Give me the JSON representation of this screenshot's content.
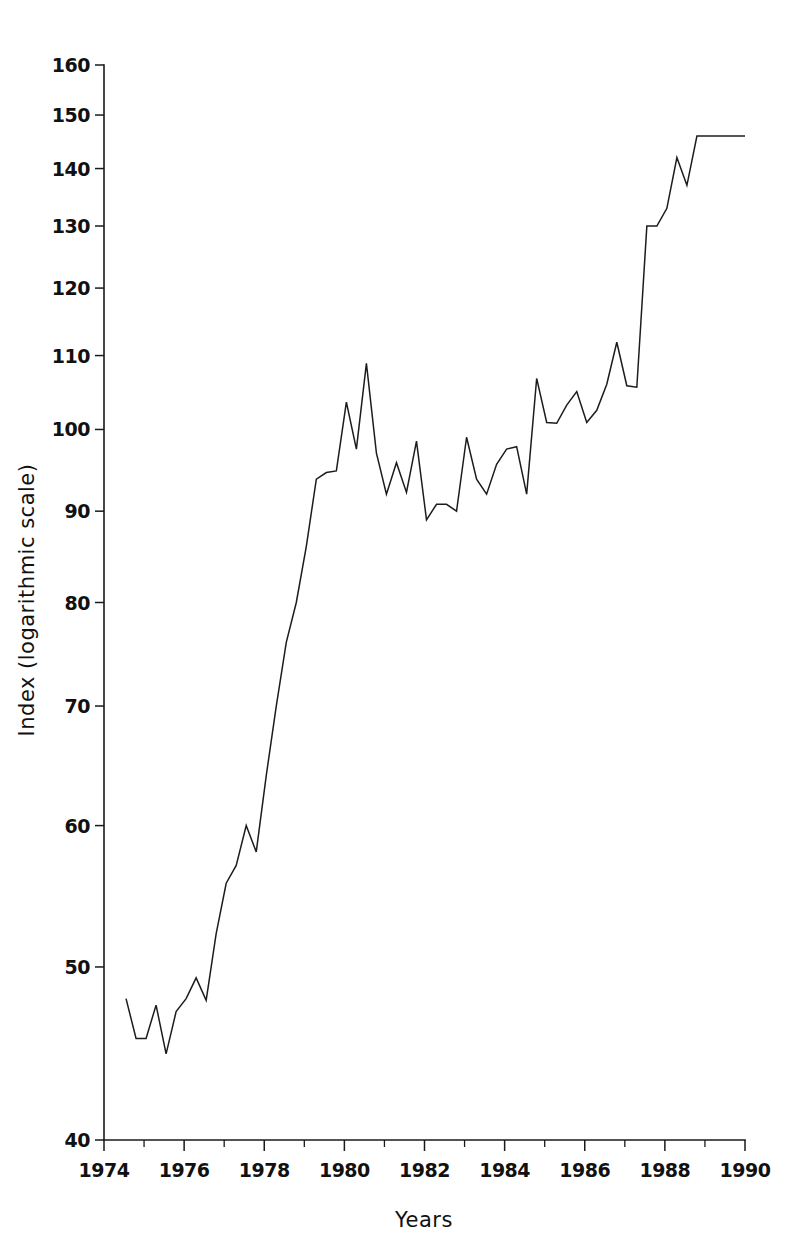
{
  "chart_data": {
    "type": "line",
    "title": "",
    "subtitle": "",
    "xlabel": "Years",
    "ylabel": "Index (logarithmic scale)",
    "yscale": "log",
    "ylim": [
      40,
      160
    ],
    "xlim": [
      1974,
      1990
    ],
    "grid": false,
    "legend": "none",
    "y_ticks": [
      40,
      50,
      60,
      70,
      80,
      90,
      100,
      110,
      120,
      130,
      140,
      150,
      160
    ],
    "y_tick_labels": [
      "40",
      "50",
      "60",
      "70",
      "80",
      "90",
      "100",
      "110",
      "120",
      "130",
      "140",
      "150",
      "160"
    ],
    "x_ticks_major": [
      1974,
      1976,
      1978,
      1980,
      1982,
      1984,
      1986,
      1988,
      1990
    ],
    "x_tick_labels": [
      "1974",
      "1976",
      "1978",
      "1980",
      "1982",
      "1984",
      "1986",
      "1988",
      "1990"
    ],
    "x_ticks_minor": [
      1975,
      1977,
      1979,
      1981,
      1983,
      1985,
      1987,
      1989
    ],
    "line_color": "#1c1c1c",
    "series": [
      {
        "name": "Index",
        "x": [
          1974.55,
          1974.8,
          1975.05,
          1975.3,
          1975.55,
          1975.8,
          1976.05,
          1976.3,
          1976.55,
          1976.8,
          1977.05,
          1977.3,
          1977.55,
          1977.8,
          1978.05,
          1978.3,
          1978.55,
          1978.8,
          1979.05,
          1979.3,
          1979.55,
          1979.8,
          1980.05,
          1980.3,
          1980.55,
          1980.8,
          1981.05,
          1981.3,
          1981.55,
          1981.8,
          1982.05,
          1982.3,
          1982.55,
          1982.8,
          1983.05,
          1983.3,
          1983.55,
          1983.8,
          1984.05,
          1984.3,
          1984.55,
          1984.8,
          1985.05,
          1985.3,
          1985.55,
          1985.8,
          1986.05,
          1986.3,
          1986.55,
          1986.8,
          1987.05,
          1987.3,
          1987.55,
          1987.8,
          1988.05,
          1988.3,
          1988.55,
          1988.8,
          1989.05,
          1989.3,
          1989.55,
          1989.8,
          1990.0
        ],
        "y": [
          48.0,
          45.6,
          45.6,
          47.6,
          44.7,
          47.2,
          48.0,
          49.3,
          47.9,
          52.2,
          55.7,
          57.0,
          60.0,
          58.0,
          64.0,
          70.0,
          76.0,
          80.0,
          86.0,
          93.8,
          94.6,
          94.8,
          103.6,
          97.5,
          108.9,
          97.0,
          92.0,
          95.8,
          92.2,
          98.5,
          89.0,
          90.8,
          90.8,
          90.0,
          99.0,
          93.8,
          92.0,
          95.6,
          97.5,
          97.8,
          92.0,
          106.8,
          100.9,
          100.8,
          103.2,
          105.0,
          100.9,
          102.5,
          106.0,
          111.9,
          105.8,
          105.6,
          130.0,
          130.0,
          133.0,
          142.0,
          137.0,
          146.0,
          146.0,
          146.0,
          146.0,
          146.0,
          146.0
        ]
      }
    ]
  },
  "figure": {
    "background_color": "#ffffff",
    "axis_color": "#1a1a1a"
  }
}
